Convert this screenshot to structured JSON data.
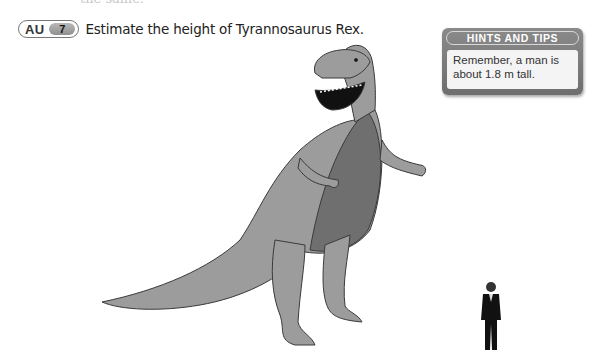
{
  "question": {
    "badge_label": "AU",
    "number": "7",
    "text": "Estimate the height of Tyrannosaurus Rex."
  },
  "hints": {
    "title": "HINTS AND TIPS",
    "body": "Remember, a man is about 1.8 m tall."
  },
  "illustrations": {
    "dinosaur": "tyrannosaurus-rex",
    "person": "man-in-suit"
  },
  "colors": {
    "dino_light": "#9c9c9c",
    "dino_dark": "#6f6f6f",
    "panel_gray": "#7a7a7a"
  }
}
